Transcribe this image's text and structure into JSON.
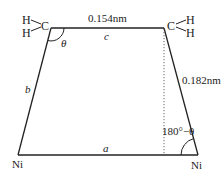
{
  "diagram": {
    "title": "",
    "colors": {
      "line": "#222222",
      "dotted": "#555555",
      "background": "#ffffff"
    },
    "groups": {
      "left_ch2": {
        "h_top": "H",
        "h_bottom": "H",
        "carbon": "C"
      },
      "right_ch2": {
        "carbon": "C",
        "h_top": "H",
        "h_bottom": "H"
      }
    },
    "atoms": {
      "ni_left": "Ni",
      "ni_right": "Ni"
    },
    "edges": {
      "top": {
        "symbol": "c",
        "length_label": "0.154nm"
      },
      "left": {
        "symbol": "b"
      },
      "right": {
        "length_label": "0.182nm"
      },
      "bottom": {
        "symbol": "a"
      }
    },
    "angles": {
      "top_left": "θ",
      "bottom_right": "180°−θ"
    }
  }
}
